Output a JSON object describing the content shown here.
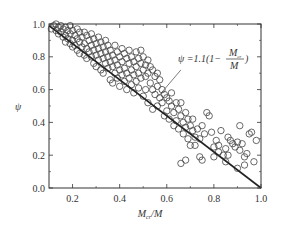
{
  "chart_data": {
    "type": "scatter",
    "title": "",
    "xlabel": "M_cr/M",
    "xlabel_main": "M",
    "xlabel_sub": "cr",
    "xlabel_tail": "/M",
    "ylabel": "ψ",
    "xlim": [
      0.1,
      1.0
    ],
    "ylim": [
      0.0,
      1.0
    ],
    "xticks": [
      0.2,
      0.4,
      0.6,
      0.8,
      1.0
    ],
    "xtick_labels": [
      "0.2",
      "0.4",
      "0.6",
      "0.8",
      "1.0"
    ],
    "yticks": [
      0.0,
      0.2,
      0.4,
      0.6,
      0.8,
      1.0
    ],
    "ytick_labels": [
      "0.0",
      "0.2",
      "0.4",
      "0.6",
      "0.8",
      "1.0"
    ],
    "grid": false,
    "legend": "none",
    "fit_line": {
      "equation": "ψ = 1.1(1 − M_cr/M)",
      "label_prefix": "ψ =1.1(1−",
      "label_num": "M",
      "label_num_sub": "cr",
      "label_den": "M",
      "label_suffix": ")",
      "x": [
        0.1,
        1.0
      ],
      "y": [
        0.99,
        0.0
      ]
    },
    "annotation_pointer": {
      "from": [
        0.565,
        0.56
      ],
      "to": [
        0.66,
        0.72
      ]
    },
    "series": [
      {
        "name": "test data",
        "marker": "open-circle",
        "points": [
          [
            0.11,
            0.97
          ],
          [
            0.12,
            0.99
          ],
          [
            0.13,
            1.0
          ],
          [
            0.13,
            0.96
          ],
          [
            0.14,
            0.98
          ],
          [
            0.14,
            0.94
          ],
          [
            0.15,
            0.99
          ],
          [
            0.15,
            0.95
          ],
          [
            0.16,
            0.97
          ],
          [
            0.16,
            0.92
          ],
          [
            0.17,
            0.98
          ],
          [
            0.17,
            0.93
          ],
          [
            0.17,
            0.89
          ],
          [
            0.18,
            0.96
          ],
          [
            0.18,
            0.91
          ],
          [
            0.19,
            0.99
          ],
          [
            0.19,
            0.94
          ],
          [
            0.19,
            0.88
          ],
          [
            0.2,
            0.96
          ],
          [
            0.2,
            0.9
          ],
          [
            0.2,
            0.86
          ],
          [
            0.21,
            0.93
          ],
          [
            0.21,
            0.87
          ],
          [
            0.22,
            0.97
          ],
          [
            0.22,
            0.91
          ],
          [
            0.22,
            0.84
          ],
          [
            0.23,
            0.95
          ],
          [
            0.23,
            0.89
          ],
          [
            0.23,
            0.82
          ],
          [
            0.24,
            0.92
          ],
          [
            0.24,
            0.86
          ],
          [
            0.25,
            0.95
          ],
          [
            0.25,
            0.88
          ],
          [
            0.25,
            0.81
          ],
          [
            0.26,
            0.93
          ],
          [
            0.26,
            0.85
          ],
          [
            0.26,
            0.79
          ],
          [
            0.27,
            0.9
          ],
          [
            0.27,
            0.83
          ],
          [
            0.28,
            0.94
          ],
          [
            0.28,
            0.87
          ],
          [
            0.28,
            0.8
          ],
          [
            0.29,
            0.91
          ],
          [
            0.29,
            0.84
          ],
          [
            0.29,
            0.76
          ],
          [
            0.3,
            0.88
          ],
          [
            0.3,
            0.81
          ],
          [
            0.3,
            0.74
          ],
          [
            0.31,
            0.92
          ],
          [
            0.31,
            0.85
          ],
          [
            0.31,
            0.78
          ],
          [
            0.32,
            0.89
          ],
          [
            0.32,
            0.82
          ],
          [
            0.32,
            0.72
          ],
          [
            0.33,
            0.86
          ],
          [
            0.33,
            0.79
          ],
          [
            0.33,
            0.7
          ],
          [
            0.34,
            0.9
          ],
          [
            0.34,
            0.83
          ],
          [
            0.34,
            0.76
          ],
          [
            0.35,
            0.87
          ],
          [
            0.35,
            0.8
          ],
          [
            0.35,
            0.73
          ],
          [
            0.36,
            0.84
          ],
          [
            0.36,
            0.77
          ],
          [
            0.36,
            0.66
          ],
          [
            0.37,
            0.81
          ],
          [
            0.37,
            0.74
          ],
          [
            0.37,
            0.64
          ],
          [
            0.38,
            0.87
          ],
          [
            0.38,
            0.78
          ],
          [
            0.38,
            0.7
          ],
          [
            0.39,
            0.83
          ],
          [
            0.39,
            0.75
          ],
          [
            0.39,
            0.67
          ],
          [
            0.4,
            0.8
          ],
          [
            0.4,
            0.72
          ],
          [
            0.4,
            0.62
          ],
          [
            0.41,
            0.85
          ],
          [
            0.41,
            0.77
          ],
          [
            0.41,
            0.69
          ],
          [
            0.42,
            0.82
          ],
          [
            0.42,
            0.73
          ],
          [
            0.42,
            0.65
          ],
          [
            0.43,
            0.79
          ],
          [
            0.43,
            0.7
          ],
          [
            0.43,
            0.6
          ],
          [
            0.44,
            0.84
          ],
          [
            0.44,
            0.76
          ],
          [
            0.44,
            0.67
          ],
          [
            0.45,
            0.8
          ],
          [
            0.45,
            0.72
          ],
          [
            0.45,
            0.63
          ],
          [
            0.46,
            0.77
          ],
          [
            0.46,
            0.69
          ],
          [
            0.46,
            0.58
          ],
          [
            0.47,
            0.83
          ],
          [
            0.47,
            0.74
          ],
          [
            0.47,
            0.65
          ],
          [
            0.48,
            0.79
          ],
          [
            0.48,
            0.7
          ],
          [
            0.48,
            0.61
          ],
          [
            0.49,
            0.84
          ],
          [
            0.49,
            0.76
          ],
          [
            0.49,
            0.67
          ],
          [
            0.5,
            0.8
          ],
          [
            0.5,
            0.72
          ],
          [
            0.5,
            0.56
          ],
          [
            0.51,
            0.75
          ],
          [
            0.51,
            0.68
          ],
          [
            0.51,
            0.6
          ],
          [
            0.52,
            0.78
          ],
          [
            0.52,
            0.7
          ],
          [
            0.52,
            0.52
          ],
          [
            0.53,
            0.74
          ],
          [
            0.53,
            0.64
          ],
          [
            0.54,
            0.72
          ],
          [
            0.54,
            0.6
          ],
          [
            0.54,
            0.48
          ],
          [
            0.55,
            0.68
          ],
          [
            0.55,
            0.57
          ],
          [
            0.56,
            0.7
          ],
          [
            0.56,
            0.62
          ],
          [
            0.56,
            0.5
          ],
          [
            0.57,
            0.66
          ],
          [
            0.57,
            0.55
          ],
          [
            0.58,
            0.6
          ],
          [
            0.58,
            0.52
          ],
          [
            0.59,
            0.57
          ],
          [
            0.59,
            0.44
          ],
          [
            0.6,
            0.55
          ],
          [
            0.6,
            0.47
          ],
          [
            0.61,
            0.53
          ],
          [
            0.61,
            0.42
          ],
          [
            0.62,
            0.58
          ],
          [
            0.62,
            0.5
          ],
          [
            0.63,
            0.46
          ],
          [
            0.63,
            0.38
          ],
          [
            0.64,
            0.52
          ],
          [
            0.64,
            0.41
          ],
          [
            0.65,
            0.48
          ],
          [
            0.65,
            0.36
          ],
          [
            0.66,
            0.44
          ],
          [
            0.66,
            0.52
          ],
          [
            0.67,
            0.4
          ],
          [
            0.67,
            0.33
          ],
          [
            0.68,
            0.46
          ],
          [
            0.68,
            0.37
          ],
          [
            0.69,
            0.42
          ],
          [
            0.69,
            0.3
          ],
          [
            0.7,
            0.38
          ],
          [
            0.7,
            0.26
          ],
          [
            0.71,
            0.35
          ],
          [
            0.71,
            0.42
          ],
          [
            0.72,
            0.31
          ],
          [
            0.72,
            0.26
          ],
          [
            0.73,
            0.36
          ],
          [
            0.74,
            0.3
          ],
          [
            0.75,
            0.38
          ],
          [
            0.76,
            0.33
          ],
          [
            0.77,
            0.46
          ],
          [
            0.78,
            0.44
          ],
          [
            0.79,
            0.34
          ],
          [
            0.8,
            0.25
          ],
          [
            0.81,
            0.29
          ],
          [
            0.82,
            0.26
          ],
          [
            0.82,
            0.22
          ],
          [
            0.83,
            0.35
          ],
          [
            0.84,
            0.2
          ],
          [
            0.85,
            0.24
          ],
          [
            0.86,
            0.2
          ],
          [
            0.86,
            0.31
          ],
          [
            0.87,
            0.29
          ],
          [
            0.88,
            0.27
          ],
          [
            0.89,
            0.25
          ],
          [
            0.9,
            0.28
          ],
          [
            0.91,
            0.23
          ],
          [
            0.91,
            0.38
          ],
          [
            0.92,
            0.27
          ],
          [
            0.93,
            0.19
          ],
          [
            0.94,
            0.21
          ],
          [
            0.95,
            0.33
          ],
          [
            0.96,
            0.34
          ],
          [
            0.97,
            0.16
          ],
          [
            0.98,
            0.29
          ],
          [
            0.74,
            0.19
          ],
          [
            0.75,
            0.17
          ],
          [
            0.66,
            0.15
          ],
          [
            0.68,
            0.17
          ],
          [
            0.8,
            0.19
          ],
          [
            0.85,
            0.16
          ],
          [
            0.9,
            0.12
          ],
          [
            0.93,
            0.14
          ]
        ]
      }
    ]
  }
}
